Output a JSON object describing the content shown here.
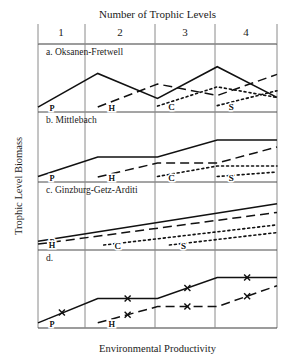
{
  "figure": {
    "top_title": "Number of Trophic Levels",
    "x_axis_label": "Environmental  Productivity",
    "y_axis_label": "Trophic Level Biomass",
    "tick_labels": [
      "1",
      "2",
      "3",
      "4"
    ],
    "curve_labels": [
      "P",
      "H",
      "C",
      "S"
    ],
    "marker_glyph": "x",
    "line_color": "#111111",
    "grid_color": "#8a8a8a"
  },
  "chart_data": {
    "type": "line",
    "title": "Number of Trophic Levels",
    "xlabel": "Environmental  Productivity",
    "ylabel": "Trophic Level Biomass",
    "grid": true,
    "legend": "inline-labels",
    "xlim": [
      0,
      4
    ],
    "ylim": [
      0,
      1
    ],
    "x_tick_labels": [
      "1",
      "2",
      "3",
      "4"
    ],
    "x_tick_positions": [
      0.5,
      1.5,
      2.5,
      3.5
    ],
    "gridline_positions": [
      1,
      2,
      3
    ],
    "panels": [
      {
        "id": "a",
        "label": "a. Oksanen-Fretwell",
        "series": [
          {
            "name": "P",
            "label": "P",
            "style": "solid",
            "x": [
              0.0,
              1.0,
              2.0,
              3.0,
              4.0
            ],
            "y": [
              0.02,
              0.72,
              0.2,
              0.86,
              0.22
            ]
          },
          {
            "name": "H",
            "label": "H",
            "style": "dashed",
            "x": [
              1.0,
              2.0,
              3.0,
              4.0
            ],
            "y": [
              0.02,
              0.5,
              0.26,
              0.7
            ]
          },
          {
            "name": "C",
            "label": "C",
            "style": "dotted",
            "x": [
              2.0,
              3.0,
              4.0
            ],
            "y": [
              0.04,
              0.44,
              0.22
            ]
          },
          {
            "name": "S",
            "label": "S",
            "style": "dotted",
            "x": [
              3.0,
              4.0
            ],
            "y": [
              0.05,
              0.36
            ]
          }
        ]
      },
      {
        "id": "b",
        "label": "b. Mittlebach",
        "series": [
          {
            "name": "P",
            "label": "P",
            "style": "solid",
            "x": [
              0.0,
              1.0,
              2.0,
              3.0,
              4.0
            ],
            "y": [
              0.03,
              0.42,
              0.42,
              0.76,
              0.76
            ]
          },
          {
            "name": "H",
            "label": "H",
            "style": "dashed",
            "x": [
              1.0,
              2.0,
              3.0,
              4.0
            ],
            "y": [
              0.02,
              0.3,
              0.3,
              0.62
            ]
          },
          {
            "name": "C",
            "label": "C",
            "style": "dotted",
            "x": [
              2.0,
              3.0,
              4.0
            ],
            "y": [
              0.03,
              0.24,
              0.24
            ]
          },
          {
            "name": "S",
            "label": "S",
            "style": "dotted",
            "x": [
              3.0,
              4.0
            ],
            "y": [
              0.03,
              0.12
            ]
          }
        ]
      },
      {
        "id": "c",
        "label": "c. Ginzburg-Getz-Arditi",
        "series": [
          {
            "name": "P",
            "label": "P",
            "style": "solid",
            "x": [
              0.0,
              4.0
            ],
            "y": [
              0.1,
              0.88
            ]
          },
          {
            "name": "H",
            "label": "H",
            "style": "dashed",
            "x": [
              0.0,
              4.0
            ],
            "y": [
              0.04,
              0.7
            ]
          },
          {
            "name": "C",
            "label": "C",
            "style": "dotted",
            "x": [
              1.1,
              4.0
            ],
            "y": [
              0.02,
              0.44
            ]
          },
          {
            "name": "S",
            "label": "S",
            "style": "dotted",
            "x": [
              2.2,
              4.0
            ],
            "y": [
              0.02,
              0.28
            ]
          }
        ]
      },
      {
        "id": "d",
        "label": "d.",
        "series": [
          {
            "name": "P",
            "label": "P",
            "style": "solid-marked",
            "x": [
              0.0,
              1.0,
              2.0,
              3.0,
              4.0
            ],
            "y": [
              0.02,
              0.44,
              0.44,
              0.8,
              0.8
            ],
            "markers_x": [
              0.4,
              1.5,
              2.5,
              3.5
            ],
            "markers_y": [
              0.2,
              0.44,
              0.62,
              0.8
            ]
          },
          {
            "name": "H",
            "label": "H",
            "style": "dashed-marked",
            "x": [
              1.0,
              2.0,
              3.0,
              4.0
            ],
            "y": [
              0.02,
              0.3,
              0.3,
              0.66
            ],
            "markers_x": [
              1.5,
              2.5,
              3.5
            ],
            "markers_y": [
              0.16,
              0.3,
              0.48
            ]
          }
        ]
      }
    ]
  }
}
